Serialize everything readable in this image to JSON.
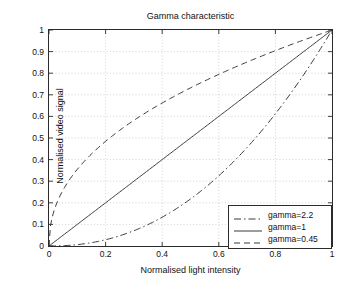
{
  "chart_data": {
    "type": "line",
    "title": "Gamma characteristic",
    "xlabel": "Normalised light intensity",
    "ylabel": "Normalised video signal",
    "xlim": [
      0,
      1
    ],
    "ylim": [
      0,
      1
    ],
    "grid": true,
    "legend_position": "lower right",
    "xticks": [
      "0",
      "0.2",
      "0.4",
      "0.6",
      "0.8",
      "1"
    ],
    "xtick_values": [
      0,
      0.2,
      0.4,
      0.6,
      0.8,
      1
    ],
    "yticks": [
      "0",
      "0.1",
      "0.2",
      "0.3",
      "0.4",
      "0.5",
      "0.6",
      "0.7",
      "0.8",
      "0.9",
      "1"
    ],
    "ytick_values": [
      0,
      0.1,
      0.2,
      0.3,
      0.4,
      0.5,
      0.6,
      0.7,
      0.8,
      0.9,
      1
    ],
    "x": [
      0,
      0.02,
      0.04,
      0.06,
      0.08,
      0.1,
      0.15,
      0.2,
      0.25,
      0.3,
      0.35,
      0.4,
      0.45,
      0.5,
      0.55,
      0.6,
      0.65,
      0.7,
      0.75,
      0.8,
      0.85,
      0.9,
      0.95,
      1
    ],
    "series": [
      {
        "name": "gamma=2.2",
        "label": "gamma=2.2",
        "gamma": 2.2,
        "style": "dash-dot",
        "color": "#3a3a3a",
        "values": [
          0,
          0.0002,
          0.0009,
          0.0022,
          0.0042,
          0.0069,
          0.0168,
          0.0315,
          0.0512,
          0.0761,
          0.1065,
          0.1424,
          0.1841,
          0.2176,
          0.2803,
          0.3293,
          0.3945,
          0.4534,
          0.5286,
          0.6047,
          0.6873,
          0.7763,
          0.8719,
          1
        ]
      },
      {
        "name": "gamma=1",
        "label": "gamma=1",
        "gamma": 1,
        "style": "solid",
        "color": "#3a3a3a",
        "values": [
          0,
          0.02,
          0.04,
          0.06,
          0.08,
          0.1,
          0.15,
          0.2,
          0.25,
          0.3,
          0.35,
          0.4,
          0.45,
          0.5,
          0.55,
          0.6,
          0.65,
          0.7,
          0.75,
          0.8,
          0.85,
          0.9,
          0.95,
          1
        ]
      },
      {
        "name": "gamma=0.45",
        "label": "gamma=0.45",
        "gamma": 0.45,
        "style": "dashed",
        "color": "#3a3a3a",
        "values": [
          0,
          0.1684,
          0.2301,
          0.2768,
          0.3144,
          0.3467,
          0.4154,
          0.4737,
          0.5235,
          0.5682,
          0.6092,
          0.6471,
          0.6825,
          0.7158,
          0.7474,
          0.7775,
          0.8062,
          0.8337,
          0.8602,
          0.8857,
          0.9104,
          0.9344,
          0.9576,
          1
        ]
      }
    ],
    "colors": {
      "axis": "#2b2b2b",
      "grid": "#c8c8c8",
      "curve": "#3a3a3a",
      "background": "#ffffff"
    }
  }
}
